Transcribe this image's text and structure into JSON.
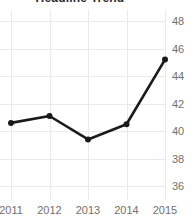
{
  "chart_data": {
    "type": "line",
    "title": "Headline Trend",
    "xlabel": "",
    "ylabel": "",
    "categories": [
      "2011",
      "2012",
      "2013",
      "2014",
      "2015"
    ],
    "x": [
      2011,
      2012,
      2013,
      2014,
      2015
    ],
    "values": [
      40.6,
      41.1,
      39.4,
      40.5,
      45.2
    ],
    "series": [
      {
        "name": "",
        "values": [
          40.6,
          41.1,
          39.4,
          40.5,
          45.2
        ]
      }
    ],
    "ylim": [
      35.0,
      48.8
    ],
    "yticks": [
      48,
      46,
      44,
      42,
      40,
      38,
      36
    ],
    "ytick_labels": [
      "48",
      "46",
      "44",
      "42",
      "40",
      "38",
      "36"
    ],
    "xticks": [
      2011,
      2012,
      2013,
      2014,
      2015
    ],
    "xtick_labels": [
      "2011",
      "2012",
      "2013",
      "2014",
      "2015"
    ],
    "grid": true,
    "grid_axis": "both",
    "legend": false,
    "legend_position": "none",
    "marker": "circle",
    "line_color": "#1a1a1a",
    "marker_color": "#1a1a1a",
    "grid_color": "#e9e9e9",
    "tick_label_color": "#6f6f6f",
    "title_color": "#2b2b2b",
    "background_color": "#ffffff",
    "y_axis_side": "right",
    "annotations": []
  }
}
